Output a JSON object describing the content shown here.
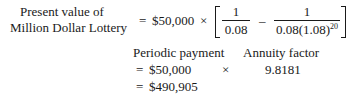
{
  "formula": {
    "label_line1": "Present value of",
    "label_line2": "Million Dollar Lottery",
    "eq1": "=",
    "payment_expr": "$50,000",
    "times1": "×",
    "frac1_num": "1",
    "frac1_den": "0.08",
    "minus": "–",
    "frac2_num": "1",
    "frac2_den_base": "0.08(1.08)",
    "frac2_den_exp": "20"
  },
  "breakdown": {
    "col1_header": "Periodic payment",
    "col2_header": "Annuity factor",
    "eq2": "=",
    "payment_value": "$50,000",
    "times2": "×",
    "annuity_factor": "9.8181",
    "eq3": "=",
    "result": "$490,905"
  }
}
